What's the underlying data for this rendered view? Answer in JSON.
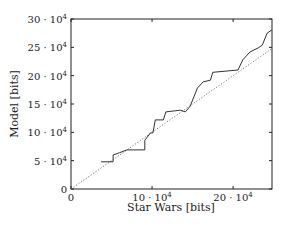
{
  "chart_data": {
    "type": "line",
    "title": "",
    "xlabel": "Star Wars [bits]",
    "ylabel": "Model [bits]",
    "xlim": [
      0,
      24.8
    ],
    "ylim": [
      0,
      30
    ],
    "unit_multiplier": "10^4",
    "grid": false,
    "legend": "none",
    "x_ticks": [
      {
        "value": 0,
        "label": "0",
        "exp": ""
      },
      {
        "value": 10,
        "label": "10 · 10",
        "exp": "4"
      },
      {
        "value": 20,
        "label": "20 · 10",
        "exp": "4"
      }
    ],
    "y_ticks": [
      {
        "value": 0,
        "label": "0",
        "exp": ""
      },
      {
        "value": 5,
        "label": "5 · 10",
        "exp": "4"
      },
      {
        "value": 10,
        "label": "10 · 10",
        "exp": "4"
      },
      {
        "value": 15,
        "label": "15 · 10",
        "exp": "4"
      },
      {
        "value": 20,
        "label": "20 · 10",
        "exp": "4"
      },
      {
        "value": 25,
        "label": "25 · 10",
        "exp": "4"
      },
      {
        "value": 30,
        "label": "30 · 10",
        "exp": "4"
      }
    ],
    "series": [
      {
        "name": "model",
        "style": "solid",
        "x": [
          3.7,
          5.2,
          5.2,
          6.0,
          6.9,
          9.1,
          9.1,
          9.8,
          10.1,
          10.4,
          11.4,
          11.7,
          13.5,
          14.1,
          14.7,
          15.6,
          16.3,
          17.2,
          17.5,
          20.6,
          21.2,
          22.1,
          23.1,
          23.6,
          24.2,
          24.8
        ],
        "y": [
          4.8,
          4.8,
          6.0,
          6.4,
          6.9,
          6.9,
          8.6,
          9.9,
          9.9,
          12.2,
          12.2,
          13.6,
          13.9,
          13.6,
          14.6,
          17.8,
          18.9,
          19.2,
          20.6,
          21.0,
          22.8,
          24.2,
          24.9,
          25.4,
          27.5,
          28.1
        ]
      },
      {
        "name": "reference-diagonal",
        "style": "dotted",
        "x": [
          0,
          24.8
        ],
        "y": [
          0,
          24.8
        ]
      }
    ]
  }
}
